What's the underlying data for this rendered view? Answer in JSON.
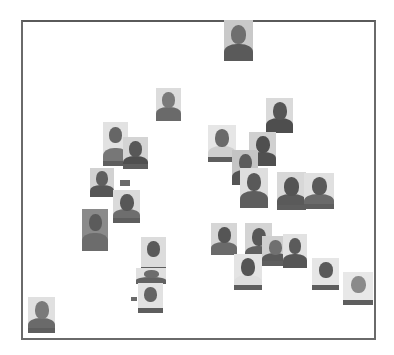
{
  "chart_data": {
    "type": "scatter",
    "title": "",
    "xlabel": "",
    "ylabel": "",
    "grid": false,
    "legend": null,
    "marker": "face-thumbnail-image",
    "frame": {
      "x": 21,
      "y": 20,
      "width": 353,
      "height": 318,
      "border_color": "#666666"
    },
    "points": [
      {
        "id": 1,
        "x": 224,
        "y": 20,
        "w": 29,
        "h": 41,
        "bg": "#c9c9c9",
        "head": "#6f6f6f",
        "body": "#5a5a5a",
        "label": false
      },
      {
        "id": 2,
        "x": 156,
        "y": 88,
        "w": 25,
        "h": 33,
        "bg": "#dcdcdc",
        "head": "#7a7a7a",
        "body": "#6a6a6a",
        "label": false
      },
      {
        "id": 3,
        "x": 266,
        "y": 98,
        "w": 27,
        "h": 35,
        "bg": "#dadada",
        "head": "#555555",
        "body": "#4e4e4e",
        "label": false
      },
      {
        "id": 4,
        "x": 103,
        "y": 122,
        "w": 25,
        "h": 44,
        "bg": "#e2e2e2",
        "head": "#666666",
        "body": "#777777",
        "label": true
      },
      {
        "id": 5,
        "x": 123,
        "y": 137,
        "w": 25,
        "h": 32,
        "bg": "#d4d4d4",
        "head": "#585858",
        "body": "#4f4f4f",
        "label": true
      },
      {
        "id": 6,
        "x": 208,
        "y": 125,
        "w": 28,
        "h": 37,
        "bg": "#e6e6e6",
        "head": "#6a6a6a",
        "body": "#cfcfcf",
        "label": true
      },
      {
        "id": 7,
        "x": 249,
        "y": 132,
        "w": 27,
        "h": 34,
        "bg": "#d0d0d0",
        "head": "#4f4f4f",
        "body": "#505050",
        "label": false
      },
      {
        "id": 8,
        "x": 232,
        "y": 150,
        "w": 26,
        "h": 35,
        "bg": "#c4c4c4",
        "head": "#5c5c5c",
        "body": "#555555",
        "label": false
      },
      {
        "id": 9,
        "x": 240,
        "y": 168,
        "w": 28,
        "h": 40,
        "bg": "#dedede",
        "head": "#595959",
        "body": "#5e5e5e",
        "label": true
      },
      {
        "id": 10,
        "x": 277,
        "y": 172,
        "w": 29,
        "h": 38,
        "bg": "#d8d8d8",
        "head": "#545454",
        "body": "#5a5a5a",
        "label": true
      },
      {
        "id": 11,
        "x": 304,
        "y": 173,
        "w": 30,
        "h": 36,
        "bg": "#e0e0e0",
        "head": "#5a5a5a",
        "body": "#6a6a6a",
        "label": true
      },
      {
        "id": 12,
        "x": 90,
        "y": 168,
        "w": 24,
        "h": 29,
        "bg": "#d2d2d2",
        "head": "#5e5e5e",
        "body": "#565656",
        "label": false
      },
      {
        "id": 13,
        "x": 113,
        "y": 190,
        "w": 27,
        "h": 33,
        "bg": "#dadada",
        "head": "#575757",
        "body": "#6e6e6e",
        "label": true
      },
      {
        "id": 14,
        "x": 82,
        "y": 209,
        "w": 26,
        "h": 42,
        "bg": "#8a8a8a",
        "head": "#5b5b5b",
        "body": "#6c6c6c",
        "label": false
      },
      {
        "id": 15,
        "x": 211,
        "y": 223,
        "w": 26,
        "h": 32,
        "bg": "#d6d6d6",
        "head": "#555555",
        "body": "#6a6a6a",
        "label": false
      },
      {
        "id": 16,
        "x": 245,
        "y": 223,
        "w": 27,
        "h": 39,
        "bg": "#d4d4d4",
        "head": "#585858",
        "body": "#606060",
        "label": false
      },
      {
        "id": 17,
        "x": 262,
        "y": 236,
        "w": 26,
        "h": 30,
        "bg": "#cfcfcf",
        "head": "#707070",
        "body": "#5a5a5a",
        "label": true
      },
      {
        "id": 18,
        "x": 283,
        "y": 234,
        "w": 24,
        "h": 34,
        "bg": "#e2e2e2",
        "head": "#5b5b5b",
        "body": "#565656",
        "label": false
      },
      {
        "id": 19,
        "x": 234,
        "y": 254,
        "w": 28,
        "h": 36,
        "bg": "#e4e4e4",
        "head": "#555555",
        "body": "#dedede",
        "label": true
      },
      {
        "id": 20,
        "x": 141,
        "y": 237,
        "w": 25,
        "h": 35,
        "bg": "#dcdcdc",
        "head": "#5a5a5a",
        "body": "#dcdcdc",
        "label": true
      },
      {
        "id": 21,
        "x": 136,
        "y": 268,
        "w": 30,
        "h": 16,
        "bg": "#e0e0e0",
        "head": "#6c6c6c",
        "body": "#626262",
        "label": false
      },
      {
        "id": 22,
        "x": 138,
        "y": 283,
        "w": 25,
        "h": 30,
        "bg": "#e2e2e2",
        "head": "#646464",
        "body": "#e2e2e2",
        "label": true
      },
      {
        "id": 23,
        "x": 312,
        "y": 258,
        "w": 27,
        "h": 32,
        "bg": "#e6e6e6",
        "head": "#5a5a5a",
        "body": "#e6e6e6",
        "label": true
      },
      {
        "id": 24,
        "x": 343,
        "y": 272,
        "w": 30,
        "h": 33,
        "bg": "#e8e8e8",
        "head": "#8a8a8a",
        "body": "#e8e8e8",
        "label": true
      },
      {
        "id": 25,
        "x": 28,
        "y": 297,
        "w": 27,
        "h": 36,
        "bg": "#e0e0e0",
        "head": "#7a7a7a",
        "body": "#6a6a6a",
        "label": true
      }
    ],
    "tags": [
      {
        "x": 120,
        "y": 180,
        "w": 10,
        "h": 6
      },
      {
        "x": 131,
        "y": 297,
        "w": 6,
        "h": 4
      }
    ]
  }
}
